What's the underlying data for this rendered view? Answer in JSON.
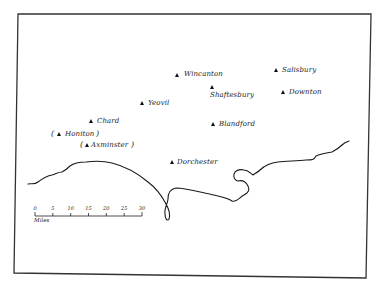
{
  "map": {
    "frame": {
      "top_left": [
        18,
        14
      ],
      "top_right": [
        371,
        14
      ],
      "bottom_right": [
        366,
        278
      ],
      "bottom_left": [
        14,
        273
      ]
    },
    "colors": {
      "ink": "#1a1a1a",
      "background": "#ffffff",
      "frame": "#333333"
    },
    "places": [
      {
        "id": "wincanton",
        "name": "Wincanton",
        "marker": [
          178,
          76
        ],
        "label": [
          184,
          72
        ],
        "parenthesized": false
      },
      {
        "id": "salisbury",
        "name": "Salisbury",
        "marker": [
          277,
          71
        ],
        "label": [
          283,
          67
        ],
        "parenthesized": false
      },
      {
        "id": "shaftesbury",
        "name": "Shaftesbury",
        "marker": [
          213,
          87
        ],
        "label": [
          210,
          92
        ],
        "parenthesized": false
      },
      {
        "id": "downton",
        "name": "Downton",
        "marker": [
          284,
          93
        ],
        "label": [
          290,
          89
        ],
        "parenthesized": false
      },
      {
        "id": "yeovil",
        "name": "Yeovil",
        "marker": [
          143,
          104
        ],
        "label": [
          149,
          100
        ],
        "parenthesized": false
      },
      {
        "id": "chard",
        "name": "Chard",
        "marker": [
          92,
          122
        ],
        "label": [
          98,
          118
        ],
        "parenthesized": false
      },
      {
        "id": "blandford",
        "name": "Blandford",
        "marker": [
          214,
          125
        ],
        "label": [
          220,
          121
        ],
        "parenthesized": false
      },
      {
        "id": "honiton",
        "name": "Honiton",
        "marker": [
          60,
          135
        ],
        "label": [
          66,
          131
        ],
        "parenthesized": true
      },
      {
        "id": "axminster",
        "name": "Axminster",
        "marker": [
          87,
          146
        ],
        "label": [
          92,
          142
        ],
        "parenthesized": true
      },
      {
        "id": "dorchester",
        "name": "Dorchester",
        "marker": [
          173,
          163
        ],
        "label": [
          178,
          159
        ],
        "parenthesized": false
      }
    ],
    "scale_bar": {
      "unit": "Miles",
      "ticks": [
        "0",
        "5",
        "10",
        "15",
        "20",
        "25",
        "30"
      ],
      "x_start": 35,
      "x_end": 142,
      "y": 216
    }
  }
}
